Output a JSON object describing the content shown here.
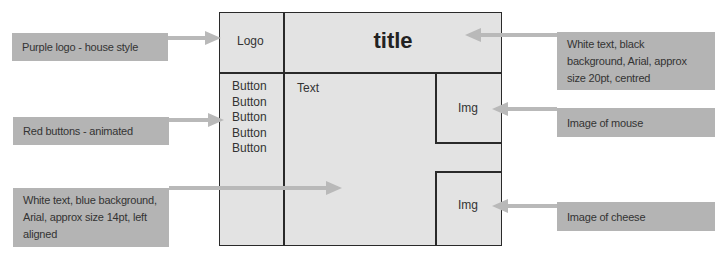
{
  "wireframe": {
    "logo_label": "Logo",
    "title_label": "title",
    "buttons": [
      "Button",
      "Button",
      "Button",
      "Button",
      "Button"
    ],
    "text_label": "Text",
    "image_top_label": "Img",
    "image_bottom_label": "Img"
  },
  "annotations": {
    "logo_note": "Purple logo - house style",
    "buttons_note": "Red buttons - animated",
    "text_note": "White text, blue background, Arial, approx size 14pt, left aligned",
    "title_note": "White text, black background, Arial, approx size 20pt, centred",
    "mouse_note": "Image of mouse",
    "cheese_note": "Image of cheese"
  },
  "colors": {
    "note_background": "#b4b4b4",
    "frame_background": "#e3e3e3",
    "frame_border": "#2a2a2a",
    "arrow": "#b9b9b9"
  }
}
